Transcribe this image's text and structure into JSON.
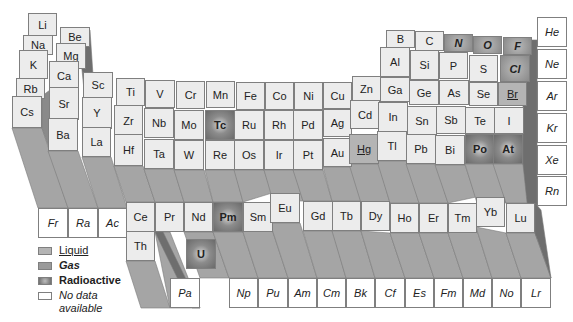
{
  "diagram": {
    "type": "3d-periodic-table",
    "legend": [
      {
        "key": "liquid",
        "label": "Liquid"
      },
      {
        "key": "gas",
        "label": "Gas"
      },
      {
        "key": "radio",
        "label": "Radioactive"
      },
      {
        "key": "nodata",
        "label": "No data available"
      }
    ],
    "colors": {
      "solid": "#ececec",
      "liquid": "#b4b4b4",
      "gas": "#9a9a9a",
      "radioactive": "#6a6a6a",
      "no_data": "#ffffff",
      "column_shadow": "#9a9a9a"
    },
    "elements": [
      {
        "s": "Li",
        "x": 28,
        "y": 13,
        "w": 29,
        "h": 23,
        "t": "solid"
      },
      {
        "s": "Be",
        "x": 60,
        "y": 27,
        "w": 30,
        "h": 20,
        "t": "solid"
      },
      {
        "s": "Na",
        "x": 23,
        "y": 35,
        "w": 30,
        "h": 20,
        "t": "solid"
      },
      {
        "s": "Mg",
        "x": 56,
        "y": 43,
        "w": 30,
        "h": 26,
        "t": "solid"
      },
      {
        "s": "K",
        "x": 19,
        "y": 50,
        "w": 29,
        "h": 29,
        "t": "solid"
      },
      {
        "s": "Ca",
        "x": 49,
        "y": 61,
        "w": 30,
        "h": 29,
        "t": "solid"
      },
      {
        "s": "Rb",
        "x": 16,
        "y": 78,
        "w": 29,
        "h": 21,
        "t": "solid"
      },
      {
        "s": "Sr",
        "x": 49,
        "y": 87,
        "w": 30,
        "h": 33,
        "t": "solid"
      },
      {
        "s": "Cs",
        "x": 12,
        "y": 96,
        "w": 30,
        "h": 32,
        "t": "solid"
      },
      {
        "s": "Ba",
        "x": 48,
        "y": 118,
        "w": 30,
        "h": 33,
        "t": "solid"
      },
      {
        "s": "Fr",
        "x": 38,
        "y": 208,
        "w": 30,
        "h": 30,
        "t": "nodata"
      },
      {
        "s": "Ra",
        "x": 68,
        "y": 208,
        "w": 30,
        "h": 30,
        "t": "nodata"
      },
      {
        "s": "Ac",
        "x": 98,
        "y": 208,
        "w": 29,
        "h": 30,
        "t": "nodata"
      },
      {
        "s": "Sc",
        "x": 83,
        "y": 72,
        "w": 30,
        "h": 26,
        "t": "solid"
      },
      {
        "s": "Y",
        "x": 82,
        "y": 97,
        "w": 30,
        "h": 32,
        "t": "solid"
      },
      {
        "s": "La",
        "x": 82,
        "y": 127,
        "w": 29,
        "h": 30,
        "t": "solid"
      },
      {
        "s": "Ti",
        "x": 116,
        "y": 78,
        "w": 29,
        "h": 28,
        "t": "solid"
      },
      {
        "s": "Zr",
        "x": 114,
        "y": 105,
        "w": 29,
        "h": 31,
        "t": "solid"
      },
      {
        "s": "Hf",
        "x": 114,
        "y": 134,
        "w": 29,
        "h": 32,
        "t": "solid"
      },
      {
        "s": "V",
        "x": 145,
        "y": 80,
        "w": 30,
        "h": 28,
        "t": "solid"
      },
      {
        "s": "Nb",
        "x": 144,
        "y": 108,
        "w": 30,
        "h": 30,
        "t": "solid"
      },
      {
        "s": "Ta",
        "x": 144,
        "y": 139,
        "w": 30,
        "h": 30,
        "t": "solid"
      },
      {
        "s": "Cr",
        "x": 176,
        "y": 81,
        "w": 29,
        "h": 28,
        "t": "solid"
      },
      {
        "s": "Mo",
        "x": 174,
        "y": 110,
        "w": 30,
        "h": 30,
        "t": "solid"
      },
      {
        "s": "W",
        "x": 174,
        "y": 140,
        "w": 30,
        "h": 30,
        "t": "solid"
      },
      {
        "s": "Mn",
        "x": 206,
        "y": 81,
        "w": 29,
        "h": 27,
        "t": "solid"
      },
      {
        "s": "Tc",
        "x": 205,
        "y": 110,
        "w": 30,
        "h": 30,
        "t": "radio"
      },
      {
        "s": "Re",
        "x": 205,
        "y": 140,
        "w": 30,
        "h": 30,
        "t": "solid"
      },
      {
        "s": "Fe",
        "x": 236,
        "y": 82,
        "w": 29,
        "h": 28,
        "t": "solid"
      },
      {
        "s": "Ru",
        "x": 234,
        "y": 110,
        "w": 30,
        "h": 30,
        "t": "solid"
      },
      {
        "s": "Os",
        "x": 234,
        "y": 140,
        "w": 30,
        "h": 30,
        "t": "solid"
      },
      {
        "s": "Co",
        "x": 265,
        "y": 82,
        "w": 29,
        "h": 28,
        "t": "solid"
      },
      {
        "s": "Rh",
        "x": 264,
        "y": 110,
        "w": 30,
        "h": 30,
        "t": "solid"
      },
      {
        "s": "Ir",
        "x": 264,
        "y": 140,
        "w": 30,
        "h": 30,
        "t": "solid"
      },
      {
        "s": "Ni",
        "x": 294,
        "y": 82,
        "w": 29,
        "h": 28,
        "t": "solid"
      },
      {
        "s": "Pd",
        "x": 293,
        "y": 110,
        "w": 30,
        "h": 30,
        "t": "solid"
      },
      {
        "s": "Pt",
        "x": 293,
        "y": 140,
        "w": 30,
        "h": 30,
        "t": "solid"
      },
      {
        "s": "Cu",
        "x": 323,
        "y": 82,
        "w": 29,
        "h": 27,
        "t": "solid"
      },
      {
        "s": "Ag",
        "x": 323,
        "y": 109,
        "w": 29,
        "h": 28,
        "t": "solid"
      },
      {
        "s": "Au",
        "x": 323,
        "y": 138,
        "w": 29,
        "h": 29,
        "t": "solid"
      },
      {
        "s": "Zn",
        "x": 352,
        "y": 76,
        "w": 29,
        "h": 25,
        "t": "solid"
      },
      {
        "s": "Cd",
        "x": 350,
        "y": 100,
        "w": 30,
        "h": 29,
        "t": "solid"
      },
      {
        "s": "Hg",
        "x": 349,
        "y": 134,
        "w": 30,
        "h": 30,
        "t": "liquid"
      },
      {
        "s": "B",
        "x": 386,
        "y": 30,
        "w": 29,
        "h": 18,
        "t": "solid"
      },
      {
        "s": "C",
        "x": 415,
        "y": 31,
        "w": 29,
        "h": 20,
        "t": "solid"
      },
      {
        "s": "N",
        "x": 444,
        "y": 34,
        "w": 29,
        "h": 18,
        "t": "gas"
      },
      {
        "s": "O",
        "x": 473,
        "y": 36,
        "w": 29,
        "h": 18,
        "t": "gas"
      },
      {
        "s": "F",
        "x": 503,
        "y": 37,
        "w": 29,
        "h": 18,
        "t": "gas"
      },
      {
        "s": "Al",
        "x": 380,
        "y": 47,
        "w": 30,
        "h": 30,
        "t": "solid"
      },
      {
        "s": "Si",
        "x": 410,
        "y": 50,
        "w": 29,
        "h": 30,
        "t": "solid"
      },
      {
        "s": "P",
        "x": 439,
        "y": 52,
        "w": 29,
        "h": 27,
        "t": "solid"
      },
      {
        "s": "S",
        "x": 469,
        "y": 55,
        "w": 29,
        "h": 27,
        "t": "solid"
      },
      {
        "s": "Cl",
        "x": 500,
        "y": 55,
        "w": 30,
        "h": 27,
        "t": "gas"
      },
      {
        "s": "Ga",
        "x": 380,
        "y": 77,
        "w": 30,
        "h": 25,
        "t": "solid"
      },
      {
        "s": "Ge",
        "x": 409,
        "y": 80,
        "w": 30,
        "h": 25,
        "t": "solid"
      },
      {
        "s": "As",
        "x": 439,
        "y": 80,
        "w": 30,
        "h": 25,
        "t": "solid"
      },
      {
        "s": "Se",
        "x": 469,
        "y": 82,
        "w": 29,
        "h": 24,
        "t": "solid"
      },
      {
        "s": "Br",
        "x": 498,
        "y": 82,
        "w": 29,
        "h": 24,
        "t": "liquid"
      },
      {
        "s": "In",
        "x": 378,
        "y": 102,
        "w": 30,
        "h": 30,
        "t": "solid"
      },
      {
        "s": "Sn",
        "x": 407,
        "y": 106,
        "w": 30,
        "h": 29,
        "t": "solid"
      },
      {
        "s": "Sb",
        "x": 436,
        "y": 106,
        "w": 30,
        "h": 28,
        "t": "solid"
      },
      {
        "s": "Te",
        "x": 465,
        "y": 107,
        "w": 30,
        "h": 27,
        "t": "solid"
      },
      {
        "s": "I",
        "x": 494,
        "y": 107,
        "w": 30,
        "h": 27,
        "t": "solid"
      },
      {
        "s": "Tl",
        "x": 377,
        "y": 131,
        "w": 30,
        "h": 30,
        "t": "solid"
      },
      {
        "s": "Pb",
        "x": 406,
        "y": 134,
        "w": 30,
        "h": 30,
        "t": "solid"
      },
      {
        "s": "Bi",
        "x": 435,
        "y": 135,
        "w": 30,
        "h": 30,
        "t": "solid"
      },
      {
        "s": "Po",
        "x": 465,
        "y": 134,
        "w": 30,
        "h": 30,
        "t": "radio"
      },
      {
        "s": "At",
        "x": 493,
        "y": 134,
        "w": 30,
        "h": 30,
        "t": "radio"
      },
      {
        "s": "He",
        "x": 537,
        "y": 17,
        "w": 30,
        "h": 30,
        "t": "nodata"
      },
      {
        "s": "Ne",
        "x": 537,
        "y": 49,
        "w": 30,
        "h": 30,
        "t": "nodata"
      },
      {
        "s": "Ar",
        "x": 537,
        "y": 81,
        "w": 30,
        "h": 30,
        "t": "nodata"
      },
      {
        "s": "Kr",
        "x": 537,
        "y": 113,
        "w": 30,
        "h": 30,
        "t": "nodata"
      },
      {
        "s": "Xe",
        "x": 537,
        "y": 145,
        "w": 30,
        "h": 30,
        "t": "nodata"
      },
      {
        "s": "Rn",
        "x": 537,
        "y": 176,
        "w": 30,
        "h": 30,
        "t": "nodata"
      },
      {
        "s": "Ce",
        "x": 126,
        "y": 202,
        "w": 29,
        "h": 30,
        "t": "solid"
      },
      {
        "s": "Pr",
        "x": 155,
        "y": 202,
        "w": 29,
        "h": 30,
        "t": "solid"
      },
      {
        "s": "Nd",
        "x": 184,
        "y": 202,
        "w": 29,
        "h": 30,
        "t": "solid"
      },
      {
        "s": "Pm",
        "x": 213,
        "y": 202,
        "w": 30,
        "h": 30,
        "t": "radio"
      },
      {
        "s": "Sm",
        "x": 243,
        "y": 202,
        "w": 30,
        "h": 30,
        "t": "solid"
      },
      {
        "s": "Eu",
        "x": 270,
        "y": 193,
        "w": 30,
        "h": 30,
        "t": "solid"
      },
      {
        "s": "Gd",
        "x": 303,
        "y": 201,
        "w": 30,
        "h": 30,
        "t": "solid"
      },
      {
        "s": "Tb",
        "x": 332,
        "y": 201,
        "w": 29,
        "h": 30,
        "t": "solid"
      },
      {
        "s": "Dy",
        "x": 361,
        "y": 201,
        "w": 29,
        "h": 30,
        "t": "solid"
      },
      {
        "s": "Ho",
        "x": 390,
        "y": 203,
        "w": 29,
        "h": 30,
        "t": "solid"
      },
      {
        "s": "Er",
        "x": 419,
        "y": 203,
        "w": 29,
        "h": 30,
        "t": "solid"
      },
      {
        "s": "Tm",
        "x": 448,
        "y": 203,
        "w": 29,
        "h": 30,
        "t": "solid"
      },
      {
        "s": "Yb",
        "x": 476,
        "y": 197,
        "w": 29,
        "h": 30,
        "t": "solid"
      },
      {
        "s": "Lu",
        "x": 506,
        "y": 203,
        "w": 29,
        "h": 30,
        "t": "solid"
      },
      {
        "s": "Th",
        "x": 126,
        "y": 231,
        "w": 29,
        "h": 30,
        "t": "solid"
      },
      {
        "s": "U",
        "x": 186,
        "y": 239,
        "w": 30,
        "h": 30,
        "t": "radio"
      },
      {
        "s": "Pa",
        "x": 170,
        "y": 278,
        "w": 30,
        "h": 30,
        "t": "nodata"
      },
      {
        "s": "Np",
        "x": 229,
        "y": 278,
        "w": 29,
        "h": 30,
        "t": "nodata"
      },
      {
        "s": "Pu",
        "x": 258,
        "y": 278,
        "w": 30,
        "h": 30,
        "t": "nodata"
      },
      {
        "s": "Am",
        "x": 288,
        "y": 278,
        "w": 29,
        "h": 30,
        "t": "nodata"
      },
      {
        "s": "Cm",
        "x": 317,
        "y": 278,
        "w": 29,
        "h": 30,
        "t": "nodata"
      },
      {
        "s": "Bk",
        "x": 346,
        "y": 278,
        "w": 29,
        "h": 30,
        "t": "nodata"
      },
      {
        "s": "Cf",
        "x": 375,
        "y": 278,
        "w": 30,
        "h": 30,
        "t": "nodata"
      },
      {
        "s": "Es",
        "x": 405,
        "y": 278,
        "w": 29,
        "h": 30,
        "t": "nodata"
      },
      {
        "s": "Fm",
        "x": 434,
        "y": 278,
        "w": 29,
        "h": 30,
        "t": "nodata"
      },
      {
        "s": "Md",
        "x": 463,
        "y": 278,
        "w": 29,
        "h": 30,
        "t": "nodata"
      },
      {
        "s": "No",
        "x": 492,
        "y": 278,
        "w": 29,
        "h": 30,
        "t": "nodata"
      },
      {
        "s": "Lr",
        "x": 521,
        "y": 278,
        "w": 30,
        "h": 30,
        "t": "nodata"
      }
    ],
    "shadows": [
      {
        "pts": "12,128 42,128 68,208 38,208",
        "tone": "#a5a5a5"
      },
      {
        "pts": "48,151 78,151 98,208 68,208",
        "tone": "#a5a5a5"
      },
      {
        "pts": "82,157 111,157 127,208 98,208",
        "tone": "#a5a5a5"
      },
      {
        "pts": "78,30 90,30 98,150 90,150",
        "tone": "#6e6e6e"
      },
      {
        "pts": "42,96 50,90 50,151 42,128",
        "tone": "#8a8a8a"
      },
      {
        "pts": "114,166 143,166 155,202 126,202",
        "tone": "#a5a5a5"
      },
      {
        "pts": "144,169 174,169 184,202 155,202",
        "tone": "#a5a5a5"
      },
      {
        "pts": "174,170 204,170 213,202 184,202",
        "tone": "#a5a5a5"
      },
      {
        "pts": "205,170 235,170 243,202 213,202",
        "tone": "#a5a5a5"
      },
      {
        "pts": "234,170 264,170 272,193 243,202",
        "tone": "#a5a5a5"
      },
      {
        "pts": "264,170 294,170 303,201 273,201",
        "tone": "#a5a5a5"
      },
      {
        "pts": "293,170 323,170 332,201 303,201",
        "tone": "#a5a5a5"
      },
      {
        "pts": "323,167 352,167 361,201 332,201",
        "tone": "#a5a5a5"
      },
      {
        "pts": "349,164 379,164 390,203 361,203",
        "tone": "#a5a5a5"
      },
      {
        "pts": "377,161 407,161 419,203 390,203",
        "tone": "#a5a5a5"
      },
      {
        "pts": "406,164 436,164 448,203 419,203",
        "tone": "#a5a5a5"
      },
      {
        "pts": "435,165 465,165 476,197 448,203",
        "tone": "#a5a5a5"
      },
      {
        "pts": "465,164 495,164 506,203 477,203",
        "tone": "#a5a5a5"
      },
      {
        "pts": "493,164 523,164 535,203 506,203",
        "tone": "#a5a5a5"
      },
      {
        "pts": "523,40 537,40 537,206 535,278 523,164",
        "tone": "#6e6e6e"
      },
      {
        "pts": "126,261 155,261 170,308 141,308",
        "tone": "#a5a5a5"
      },
      {
        "pts": "155,232 170,232 200,308 170,308",
        "tone": "#a5a5a5"
      },
      {
        "pts": "184,232 213,232 229,278 200,278",
        "tone": "#a5a5a5"
      },
      {
        "pts": "213,232 243,232 258,278 229,278",
        "tone": "#a5a5a5"
      },
      {
        "pts": "243,232 270,223 288,278 258,278",
        "tone": "#a5a5a5"
      },
      {
        "pts": "270,223 300,223 317,278 288,278",
        "tone": "#a5a5a5"
      },
      {
        "pts": "303,231 333,231 346,278 317,278",
        "tone": "#a5a5a5"
      },
      {
        "pts": "332,231 361,231 375,278 346,278",
        "tone": "#a5a5a5"
      },
      {
        "pts": "361,231 390,233 405,278 375,278",
        "tone": "#a5a5a5"
      },
      {
        "pts": "390,233 419,233 434,278 405,278",
        "tone": "#a5a5a5"
      },
      {
        "pts": "419,233 448,233 463,278 434,278",
        "tone": "#a5a5a5"
      },
      {
        "pts": "448,233 476,227 492,278 463,278",
        "tone": "#a5a5a5"
      },
      {
        "pts": "476,227 506,233 521,278 492,278",
        "tone": "#a5a5a5"
      },
      {
        "pts": "506,233 535,233 551,278 521,278",
        "tone": "#a5a5a5"
      },
      {
        "pts": "535,203 541,210 551,278 535,233",
        "tone": "#6e6e6e"
      },
      {
        "pts": "155,232 163,232 200,308 192,308",
        "tone": "#6e6e6e"
      }
    ]
  }
}
